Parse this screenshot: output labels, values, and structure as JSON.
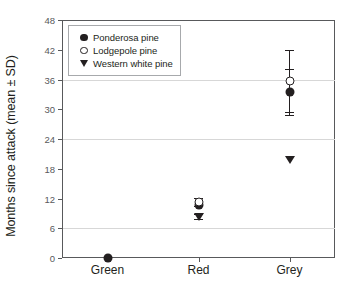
{
  "chart_data": {
    "type": "scatter",
    "title": "",
    "xlabel": "",
    "ylabel": "Months since attack (mean ± SD)",
    "categories": [
      "Green",
      "Red",
      "Grey"
    ],
    "ylim": [
      0,
      48
    ],
    "yticks": [
      0,
      6,
      12,
      18,
      24,
      30,
      36,
      42,
      48
    ],
    "gridlines": [
      6,
      24,
      36
    ],
    "grid": true,
    "legend_position": "top-left",
    "error_type": "SD",
    "series": [
      {
        "name": "Ponderosa pine",
        "marker": "filled-circle",
        "color": "#231f20",
        "points": [
          {
            "category": "Green",
            "value": 0.0,
            "sd": 0.0
          },
          {
            "category": "Red",
            "value": 10.6,
            "sd": 0.0
          },
          {
            "category": "Grey",
            "value": 33.5,
            "sd": 4.6
          }
        ]
      },
      {
        "name": "Lodgepole pine",
        "marker": "open-circle",
        "color": "#231f20",
        "points": [
          {
            "category": "Red",
            "value": 11.3,
            "sd": 0.9
          },
          {
            "category": "Grey",
            "value": 35.7,
            "sd": 6.3
          }
        ]
      },
      {
        "name": "Western white pine",
        "marker": "filled-triangle-down",
        "color": "#231f20",
        "points": [
          {
            "category": "Red",
            "value": 8.3,
            "sd": 0.5
          },
          {
            "category": "Grey",
            "value": 19.7,
            "sd": 0.0
          }
        ]
      }
    ]
  },
  "axis": {
    "y_title": "Months since attack (mean ± SD)",
    "y_tick_labels": [
      "0",
      "6",
      "12",
      "18",
      "24",
      "30",
      "36",
      "42",
      "48"
    ],
    "x_tick_labels": [
      "Green",
      "Red",
      "Grey"
    ]
  },
  "legend": {
    "entries": [
      {
        "label": "Ponderosa pine",
        "glyph": "filled-circle-icon"
      },
      {
        "label": "Lodgepole pine",
        "glyph": "open-circle-icon"
      },
      {
        "label": "Western white pine",
        "glyph": "triangle-down-icon"
      }
    ]
  },
  "colors": {
    "ink": "#231f20",
    "axis": "#58595b",
    "grid": "#d7d7d7",
    "background": "#ffffff"
  }
}
